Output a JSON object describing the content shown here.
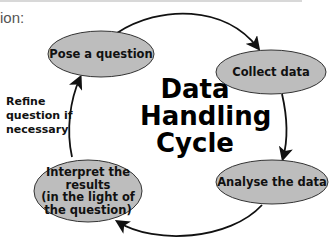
{
  "caption": "ion:",
  "diagram": {
    "title_lines": [
      "Data",
      "Handling",
      "Cycle"
    ],
    "nodes": [
      {
        "id": "pose",
        "label": "Pose a question"
      },
      {
        "id": "collect",
        "label": "Collect data"
      },
      {
        "id": "analyse",
        "label": "Analyse the data"
      },
      {
        "id": "interpret",
        "label_lines": [
          "Interpret the",
          "results",
          "(in the light of",
          "the question)"
        ]
      }
    ],
    "side_note_lines": [
      "Refine",
      "question if",
      "necessary"
    ],
    "colors": {
      "node_fill": "#bdbdbd",
      "node_stroke": "#333333",
      "arrow": "#111111"
    }
  }
}
